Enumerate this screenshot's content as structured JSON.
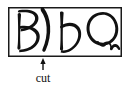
{
  "figure": {
    "name": "handwritten-glyph-box-with-cut-annotation",
    "background_color": "#ffffff",
    "ink_color": "#111111",
    "border_color": "#1a1a1a",
    "box": {
      "x": 8,
      "y": 7,
      "width": 114,
      "height": 50,
      "stroke_width": 1.5
    },
    "glyphs": [
      {
        "id": "glyph-capital-b-split",
        "label": "B",
        "description": "capital B with its bowl separated from the stem",
        "parts": [
          "B-stem-and-bowls",
          "detached-right-bowl-paren"
        ]
      },
      {
        "id": "glyph-lowercase-b",
        "label": "b",
        "description": "lowercase b"
      },
      {
        "id": "glyph-capital-q",
        "label": "Q",
        "description": "capital Q drawn as an oval with a scribbled tail"
      }
    ],
    "annotation": {
      "arrow": {
        "name": "cut-arrow",
        "direction": "up",
        "tip_x": 43,
        "tip_y": 58,
        "tail_x": 43,
        "tail_y": 70
      },
      "caption": "cut",
      "caption_x": 43,
      "caption_y": 82
    }
  }
}
